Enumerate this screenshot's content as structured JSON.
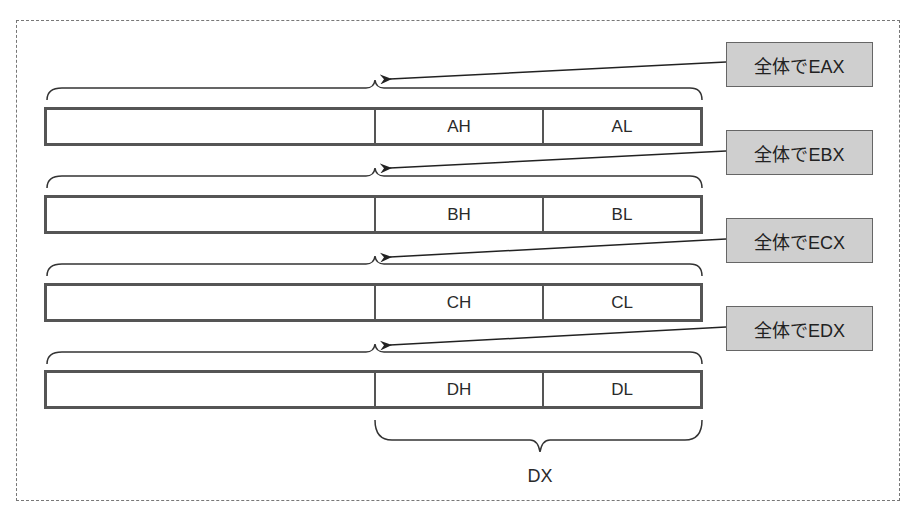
{
  "diagram": {
    "registers": [
      {
        "name": "EAX",
        "high_label": "AH",
        "low_label": "AL",
        "callout": "全体でEAX"
      },
      {
        "name": "EBX",
        "high_label": "BH",
        "low_label": "BL",
        "callout": "全体でEBX"
      },
      {
        "name": "ECX",
        "high_label": "CH",
        "low_label": "CL",
        "callout": "全体でECX"
      },
      {
        "name": "EDX",
        "high_label": "DH",
        "low_label": "DL",
        "callout": "全体でEDX"
      }
    ],
    "bottom_brace_label": "DX",
    "colors": {
      "register_border": "#555555",
      "callout_fill": "#cfcfcf",
      "frame_border": "#777777"
    }
  }
}
